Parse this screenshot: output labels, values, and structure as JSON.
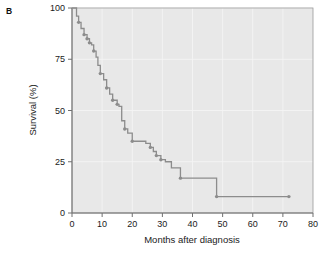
{
  "panel": {
    "label": "B"
  },
  "chart_data": {
    "type": "line",
    "subtype": "kaplan-meier-step",
    "title": "",
    "xlabel": "Months after diagnosis",
    "ylabel": "Survival (%)",
    "xlim": [
      0,
      80
    ],
    "ylim": [
      0,
      100
    ],
    "xticks": [
      0,
      10,
      20,
      30,
      40,
      50,
      60,
      70,
      80
    ],
    "xtick_labels": [
      "0",
      "10",
      "20",
      "30",
      "40",
      "50",
      "60",
      "70",
      "80"
    ],
    "yticks": [
      0,
      25,
      50,
      75,
      100
    ],
    "ytick_labels": [
      "0",
      "25",
      "50",
      "75",
      "100"
    ],
    "grid": true,
    "legend": null,
    "series": [
      {
        "name": "Survival",
        "color": "#8c8c8c",
        "step": "post",
        "x": [
          0,
          1.5,
          2.2,
          3.0,
          4.0,
          5.0,
          5.8,
          6.5,
          7.2,
          8.0,
          8.6,
          9.4,
          10.5,
          11.5,
          12.5,
          13.5,
          15.0,
          15.6,
          16.5,
          17.5,
          18.5,
          20.0,
          24.5,
          26.0,
          27.0,
          28.0,
          29.5,
          31.0,
          33.0,
          36.0,
          48.0,
          72.0
        ],
        "y": [
          100,
          96,
          93,
          90,
          87,
          85,
          83,
          82,
          79,
          76,
          72,
          68,
          65,
          61,
          58,
          55,
          53,
          52,
          45,
          41,
          39,
          35,
          34,
          32,
          30,
          28,
          26,
          25,
          22,
          17,
          8,
          8
        ]
      }
    ],
    "censor_marks": [
      {
        "x": 2.2,
        "y": 93
      },
      {
        "x": 4.0,
        "y": 87
      },
      {
        "x": 5.0,
        "y": 85
      },
      {
        "x": 5.8,
        "y": 83
      },
      {
        "x": 7.2,
        "y": 79
      },
      {
        "x": 9.4,
        "y": 68
      },
      {
        "x": 11.5,
        "y": 61
      },
      {
        "x": 13.5,
        "y": 55
      },
      {
        "x": 15.0,
        "y": 53
      },
      {
        "x": 17.5,
        "y": 41
      },
      {
        "x": 20.0,
        "y": 35
      },
      {
        "x": 26.0,
        "y": 32
      },
      {
        "x": 28.0,
        "y": 28
      },
      {
        "x": 29.5,
        "y": 26
      },
      {
        "x": 36.0,
        "y": 17
      },
      {
        "x": 48.0,
        "y": 8
      },
      {
        "x": 72.0,
        "y": 8
      }
    ],
    "colors": {
      "plot_background": "#e8e8e8",
      "gridline": "#f4f4f4",
      "curve": "#8c8c8c",
      "axis": "#707070",
      "text": "#1a1a1a"
    }
  }
}
